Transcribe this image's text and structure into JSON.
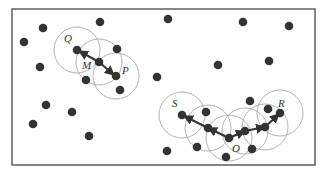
{
  "diagram": {
    "frame": {
      "x": 12,
      "y": 9,
      "w": 303,
      "h": 156,
      "stroke": "#555555"
    },
    "colors": {
      "point": "#333333",
      "circle": "#aaaaaa",
      "arrow": "#333333",
      "label": "#333333"
    },
    "point_radius": 4.3,
    "circle_radius": 23,
    "labels": [
      {
        "text": "Q",
        "x": 64,
        "y": 42
      },
      {
        "text": "M",
        "x": 82,
        "y": 69
      },
      {
        "text": "P",
        "x": 122,
        "y": 74
      },
      {
        "text": "S",
        "x": 172,
        "y": 107
      },
      {
        "text": "O",
        "x": 232,
        "y": 152
      },
      {
        "text": "R",
        "x": 278,
        "y": 107
      }
    ],
    "circles": [
      {
        "cx": 77,
        "cy": 50
      },
      {
        "cx": 99,
        "cy": 62
      },
      {
        "cx": 116,
        "cy": 76
      },
      {
        "cx": 182,
        "cy": 115
      },
      {
        "cx": 208,
        "cy": 128
      },
      {
        "cx": 229,
        "cy": 138
      },
      {
        "cx": 245,
        "cy": 131
      },
      {
        "cx": 265,
        "cy": 127
      },
      {
        "cx": 280,
        "cy": 113
      }
    ],
    "points": [
      [
        43,
        28
      ],
      [
        24,
        42
      ],
      [
        40,
        67
      ],
      [
        100,
        22
      ],
      [
        168,
        19
      ],
      [
        243,
        22
      ],
      [
        289,
        26
      ],
      [
        218,
        65
      ],
      [
        269,
        61
      ],
      [
        157,
        77
      ],
      [
        77,
        50
      ],
      [
        99,
        62
      ],
      [
        117,
        49
      ],
      [
        116,
        76
      ],
      [
        86,
        80
      ],
      [
        120,
        90
      ],
      [
        46,
        105
      ],
      [
        72,
        112
      ],
      [
        33,
        124
      ],
      [
        89,
        136
      ],
      [
        167,
        151
      ],
      [
        182,
        115
      ],
      [
        206,
        112
      ],
      [
        208,
        128
      ],
      [
        197,
        147
      ],
      [
        229,
        138
      ],
      [
        226,
        157
      ],
      [
        245,
        131
      ],
      [
        265,
        127
      ],
      [
        268,
        109
      ],
      [
        280,
        113
      ],
      [
        252,
        149
      ],
      [
        250,
        101
      ]
    ],
    "arrows": [
      {
        "x1": 99,
        "y1": 62,
        "x2": 79,
        "y2": 51
      },
      {
        "x1": 99,
        "y1": 62,
        "x2": 114,
        "y2": 75
      },
      {
        "x1": 229,
        "y1": 138,
        "x2": 208,
        "y2": 128
      },
      {
        "x1": 208,
        "y1": 128,
        "x2": 184,
        "y2": 116
      },
      {
        "x1": 229,
        "y1": 138,
        "x2": 245,
        "y2": 131
      },
      {
        "x1": 245,
        "y1": 131,
        "x2": 265,
        "y2": 127
      },
      {
        "x1": 265,
        "y1": 127,
        "x2": 279,
        "y2": 114
      }
    ]
  }
}
